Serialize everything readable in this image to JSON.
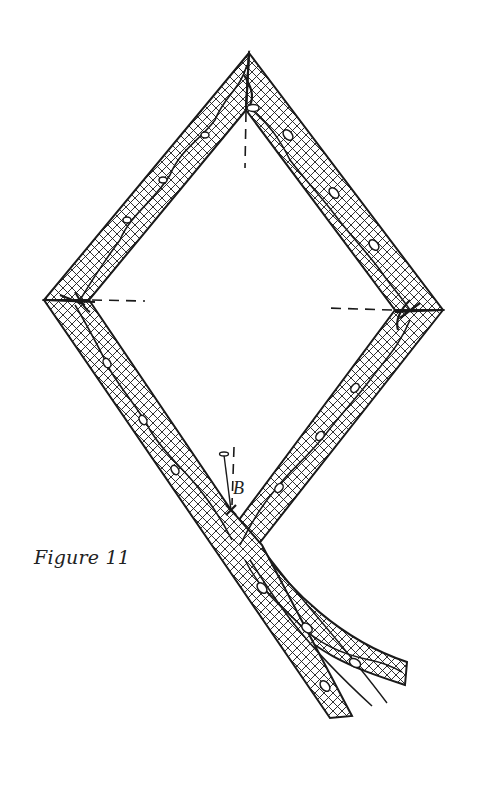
{
  "figure": {
    "caption": "Figure 11",
    "point_label": "B",
    "colors": {
      "ink": "#1a1a1a",
      "paper": "#ffffff"
    }
  },
  "geometry": {
    "outer_vertices": {
      "top": [
        249,
        53
      ],
      "left": [
        44,
        300
      ],
      "right": [
        443,
        310
      ]
    },
    "inner_vertices": {
      "top": [
        246,
        110
      ],
      "left": [
        89,
        300
      ],
      "right": [
        395,
        310
      ],
      "bottom": [
        231,
        510
      ]
    },
    "dashed_guides": [
      {
        "name": "top-guide",
        "from": [
          246,
          110
        ],
        "to": [
          245,
          168
        ]
      },
      {
        "name": "left-guide",
        "from": [
          89,
          300
        ],
        "to": [
          145,
          301
        ]
      },
      {
        "name": "right-guide",
        "from": [
          395,
          310
        ],
        "to": [
          327,
          308
        ]
      },
      {
        "name": "bottom-guide",
        "from": [
          234,
          447
        ],
        "to": [
          232,
          510
        ]
      }
    ],
    "tails": [
      {
        "name": "straight-tail",
        "end": [
          330,
          718
        ]
      },
      {
        "name": "curved-tail",
        "end": [
          407,
          668
        ]
      }
    ]
  }
}
